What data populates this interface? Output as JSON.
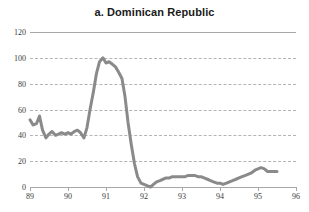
{
  "chart_data": {
    "type": "line",
    "title": "a. Dominican Republic",
    "xlabel": "",
    "ylabel": "",
    "xlim": [
      89,
      96
    ],
    "ylim": [
      0,
      120
    ],
    "grid": true,
    "legend": null,
    "x_ticks": [
      89,
      90,
      91,
      92,
      93,
      94,
      95,
      96
    ],
    "x_tick_labels": [
      "89",
      "90",
      "91",
      "92",
      "93",
      "94",
      "95",
      "96"
    ],
    "y_ticks": [
      0,
      20,
      40,
      60,
      80,
      100,
      120
    ],
    "y_tick_labels": [
      "0",
      "20",
      "40",
      "60",
      "80",
      "100",
      "120"
    ],
    "line_color": "#8a8a8a",
    "grid_color": "#b4b4b4",
    "axis_color": "#a8a8a8",
    "text_color": "#3a3a3a",
    "background": "#ffffff",
    "series": [
      {
        "name": "Dominican Republic",
        "x": [
          89.0,
          89.08,
          89.17,
          89.25,
          89.33,
          89.42,
          89.5,
          89.58,
          89.67,
          89.75,
          89.83,
          89.92,
          90.0,
          90.08,
          90.17,
          90.25,
          90.33,
          90.42,
          90.5,
          90.58,
          90.67,
          90.75,
          90.83,
          90.92,
          91.0,
          91.08,
          91.17,
          91.25,
          91.33,
          91.42,
          91.5,
          91.58,
          91.67,
          91.75,
          91.83,
          91.92,
          92.0,
          92.08,
          92.17,
          92.25,
          92.33,
          92.42,
          92.5,
          92.58,
          92.67,
          92.75,
          92.83,
          92.92,
          93.0,
          93.08,
          93.17,
          93.25,
          93.33,
          93.42,
          93.5,
          93.58,
          93.67,
          93.75,
          93.83,
          93.92,
          94.0,
          94.08,
          94.17,
          94.25,
          94.33,
          94.42,
          94.5,
          94.58,
          94.67,
          94.75,
          94.83,
          94.92,
          95.0,
          95.08,
          95.17,
          95.25,
          95.33,
          95.42,
          95.5
        ],
        "values": [
          52,
          48,
          49,
          55,
          44,
          38,
          41,
          43,
          40,
          41,
          42,
          41,
          42,
          41,
          43,
          44,
          42,
          38,
          46,
          60,
          74,
          88,
          97,
          100,
          96,
          97,
          95,
          93,
          89,
          84,
          70,
          50,
          32,
          18,
          8,
          3,
          2,
          1,
          0,
          2,
          4,
          5,
          6,
          7,
          7,
          8,
          8,
          8,
          8,
          8,
          9,
          9,
          9,
          8,
          8,
          7,
          6,
          5,
          4,
          3,
          3,
          2,
          3,
          4,
          5,
          6,
          7,
          8,
          9,
          10,
          11,
          13,
          14,
          15,
          14,
          12,
          12,
          12,
          12
        ]
      }
    ]
  }
}
